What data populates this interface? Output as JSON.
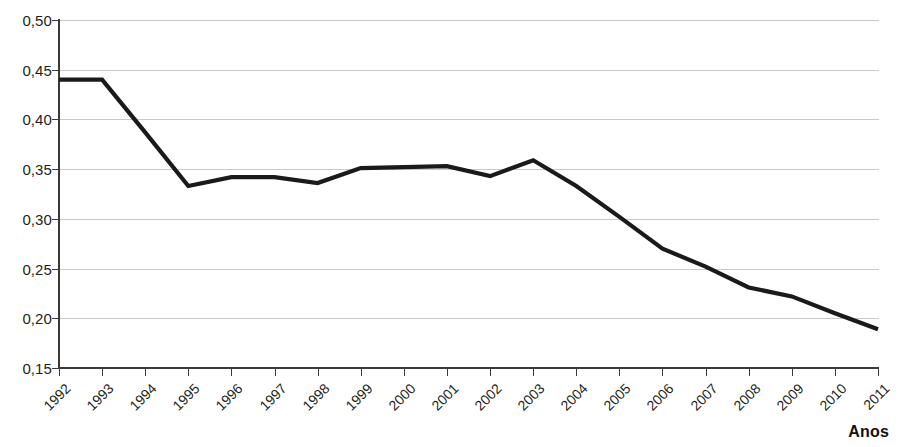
{
  "chart_data": {
    "type": "line",
    "title": "",
    "subtitle": "",
    "xlabel": "Anos",
    "ylabel": "",
    "categories": [
      "1992",
      "1993",
      "1994",
      "1995",
      "1996",
      "1997",
      "1998",
      "1999",
      "2000",
      "2001",
      "2002",
      "2003",
      "2004",
      "2005",
      "2006",
      "2007",
      "2008",
      "2009",
      "2010",
      "2011"
    ],
    "values": [
      0.44,
      0.44,
      0.387,
      0.333,
      0.342,
      0.342,
      0.336,
      0.351,
      0.352,
      0.353,
      0.343,
      0.359,
      0.333,
      0.302,
      0.27,
      0.252,
      0.231,
      0.222,
      0.205,
      0.189
    ],
    "series": [
      {
        "name": "serie-1",
        "color": "#1a1a1a",
        "values": [
          0.44,
          0.44,
          0.387,
          0.333,
          0.342,
          0.342,
          0.336,
          0.351,
          0.352,
          0.353,
          0.343,
          0.359,
          0.333,
          0.302,
          0.27,
          0.252,
          0.231,
          0.222,
          0.205,
          0.189
        ]
      }
    ],
    "ylim": [
      0.15,
      0.5
    ],
    "ytick_values": [
      0.5,
      0.45,
      0.4,
      0.35,
      0.3,
      0.25,
      0.2,
      0.15
    ],
    "ytick_labels": [
      "0,50",
      "0,45",
      "0,40",
      "0,35",
      "0,30",
      "0,25",
      "0,20",
      "0,15"
    ],
    "xtick_labels": [
      "1992",
      "1993",
      "1994",
      "1995",
      "1996",
      "1997",
      "1998",
      "1999",
      "2000",
      "2001",
      "2002",
      "2003",
      "2004",
      "2005",
      "2006",
      "2007",
      "2008",
      "2009",
      "2010",
      "2011"
    ],
    "grid": "horizontal",
    "grid_color": "#c9c9c9",
    "legend": "none",
    "legend_position": "none",
    "background_color": "#ffffff",
    "axis_color": "#3a3a3a",
    "decimal_separator": ","
  },
  "axis_titles": {
    "x": "Anos",
    "y": ""
  }
}
